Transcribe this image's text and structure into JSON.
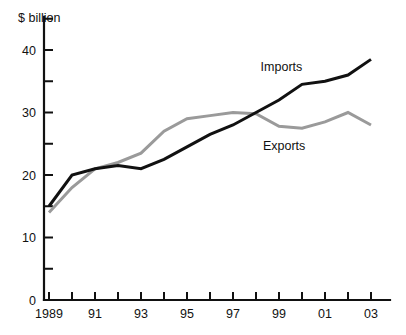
{
  "chart_data": {
    "type": "line",
    "title": "",
    "subtitle": "",
    "ylabel": "$ billion",
    "xlabel": "",
    "ylim": [
      0,
      45
    ],
    "xlim": [
      1989,
      2003
    ],
    "grid": false,
    "legend_position": "inline-annotation",
    "y_ticks_major": [
      0,
      10,
      20,
      30,
      40
    ],
    "y_ticks_minor": [
      5,
      15,
      25,
      35,
      45
    ],
    "y_tick_labels": [
      "0",
      "10",
      "20",
      "30",
      "40"
    ],
    "x": [
      1989,
      1990,
      1991,
      1992,
      1993,
      1994,
      1995,
      1996,
      1997,
      1998,
      1999,
      2000,
      2001,
      2002,
      2003
    ],
    "x_tick_labels": [
      "1989",
      "",
      "91",
      "",
      "93",
      "",
      "95",
      "",
      "97",
      "",
      "99",
      "",
      "01",
      "",
      "03"
    ],
    "series": [
      {
        "name": "Imports",
        "color": "#111111",
        "stroke_width": 3,
        "label_x": 1998.2,
        "label_y": 36.6,
        "values": [
          15.0,
          20.0,
          21.0,
          21.5,
          21.0,
          22.5,
          24.5,
          26.5,
          28.0,
          30.0,
          32.0,
          34.5,
          35.0,
          36.0,
          38.5
        ]
      },
      {
        "name": "Exports",
        "color": "#9a9a9a",
        "stroke_width": 3,
        "label_x": 1998.3,
        "label_y": 24.0,
        "values": [
          14.0,
          18.0,
          21.0,
          22.0,
          23.5,
          27.0,
          29.0,
          29.5,
          30.0,
          29.8,
          27.8,
          27.5,
          28.5,
          30.0,
          28.0
        ]
      }
    ]
  },
  "axis": {
    "y_title": "$ billion"
  }
}
